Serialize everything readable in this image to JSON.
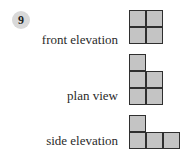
{
  "question": {
    "number": "9"
  },
  "views": [
    {
      "label": "front elevation",
      "cells": [
        [
          0,
          0
        ],
        [
          1,
          0
        ],
        [
          0,
          1
        ],
        [
          1,
          1
        ]
      ]
    },
    {
      "label": "plan view",
      "cells": [
        [
          0,
          0
        ],
        [
          0,
          1
        ],
        [
          1,
          1
        ],
        [
          0,
          2
        ],
        [
          1,
          2
        ]
      ]
    },
    {
      "label": "side elevation",
      "cells": [
        [
          0,
          0
        ],
        [
          0,
          1
        ],
        [
          1,
          1
        ],
        [
          2,
          1
        ]
      ]
    }
  ],
  "colors": {
    "cell_fill": "#c4c4c4",
    "cell_border": "#2f2f2f",
    "badge_fill": "#d9d9d9"
  }
}
